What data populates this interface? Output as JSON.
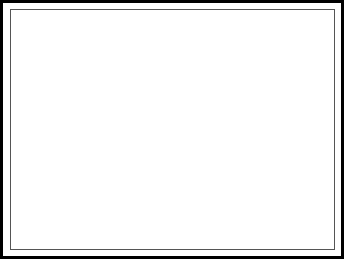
{
  "figure": {
    "type": "node-link-graph-3d",
    "background_color": "#ffffff",
    "outer_border_color": "#000000",
    "inner_border_color": "#555555",
    "edge_color": "#111111",
    "stem_color": "#222222"
  },
  "legend": {
    "node_fills": {
      "black": "#0a0a0a",
      "white": "#ffffff",
      "gray_mid": "#808080",
      "gray_light": "#c8c8c8"
    }
  },
  "base_plate": {
    "name": "pentagonal-base-plate",
    "top_face_fill": "#ffffff",
    "side_face_fill": "#ffffff",
    "stroke": "#111111",
    "thickness_px": 14,
    "top_outline": [
      [
        17,
        127
      ],
      [
        166,
        103
      ],
      [
        325,
        142
      ],
      [
        333,
        191
      ],
      [
        282,
        230
      ],
      [
        13,
        166
      ]
    ]
  },
  "chart_data": {
    "type": "scatter",
    "xlabel": "",
    "ylabel": "",
    "nodes": [
      {
        "id": "n01",
        "x": 153,
        "y": 22,
        "r": 6.5,
        "fill": "white",
        "stem": 0
      },
      {
        "id": "n02",
        "x": 170,
        "y": 20,
        "r": 9.5,
        "fill": "white",
        "stem": 0
      },
      {
        "id": "n03",
        "x": 183,
        "y": 31,
        "r": 6.5,
        "fill": "white",
        "stem": 0
      },
      {
        "id": "n04",
        "x": 152,
        "y": 35,
        "r": 10.5,
        "fill": "black",
        "stem": 0
      },
      {
        "id": "n05",
        "x": 133,
        "y": 38,
        "r": 7.5,
        "fill": "white",
        "stem": 0
      },
      {
        "id": "n06",
        "x": 148,
        "y": 46,
        "r": 7.0,
        "fill": "white",
        "stem": 0
      },
      {
        "id": "n07",
        "x": 277,
        "y": 35,
        "r": 11.5,
        "fill": "gray_light",
        "stem": 0
      },
      {
        "id": "n08",
        "x": 259,
        "y": 33,
        "r": 4.0,
        "fill": "white",
        "stem": 0
      },
      {
        "id": "n09",
        "x": 105,
        "y": 63,
        "r": 8.0,
        "fill": "gray_mid",
        "stem": 0
      },
      {
        "id": "n10",
        "x": 107,
        "y": 70,
        "r": 7.5,
        "fill": "white",
        "stem": 0
      },
      {
        "id": "n11",
        "x": 127,
        "y": 69,
        "r": 8.5,
        "fill": "black",
        "stem": 0
      },
      {
        "id": "n12",
        "x": 91,
        "y": 62,
        "r": 2.5,
        "fill": "black",
        "stem": 0
      },
      {
        "id": "n13",
        "x": 137,
        "y": 70,
        "r": 2.5,
        "fill": "black",
        "stem": 0
      },
      {
        "id": "n14",
        "x": 160,
        "y": 85,
        "r": 9.0,
        "fill": "gray_mid",
        "stem": 0
      },
      {
        "id": "n15",
        "x": 163,
        "y": 93,
        "r": 8.5,
        "fill": "black",
        "stem": 0
      },
      {
        "id": "n16",
        "x": 177,
        "y": 89,
        "r": 8.0,
        "fill": "white",
        "stem": 0
      },
      {
        "id": "n17",
        "x": 150,
        "y": 88,
        "r": 2.5,
        "fill": "black",
        "stem": 0
      },
      {
        "id": "n18",
        "x": 189,
        "y": 89,
        "r": 2.5,
        "fill": "black",
        "stem": 0
      },
      {
        "id": "n19",
        "x": 28,
        "y": 96,
        "r": 8.0,
        "fill": "gray_mid",
        "stem": 0
      },
      {
        "id": "n20",
        "x": 29,
        "y": 105,
        "r": 8.5,
        "fill": "black",
        "stem": 0
      },
      {
        "id": "n21",
        "x": 44,
        "y": 97,
        "r": 7.0,
        "fill": "white",
        "stem": 0
      },
      {
        "id": "n22",
        "x": 48,
        "y": 99,
        "r": 4.0,
        "fill": "white",
        "stem": 0
      },
      {
        "id": "n23",
        "x": 16,
        "y": 97,
        "r": 2.5,
        "fill": "black",
        "stem": 0
      },
      {
        "id": "n24",
        "x": 56,
        "y": 98,
        "r": 2.5,
        "fill": "black",
        "stem": 0
      },
      {
        "id": "n25",
        "x": 277,
        "y": 104,
        "r": 8.0,
        "fill": "gray_light",
        "stem": 0
      },
      {
        "id": "n26",
        "x": 237,
        "y": 124,
        "r": 8.5,
        "fill": "gray_mid",
        "stem": 0
      },
      {
        "id": "n27",
        "x": 214,
        "y": 135,
        "r": 9.5,
        "fill": "black",
        "stem": 0
      },
      {
        "id": "n28",
        "x": 238,
        "y": 139,
        "r": 8.5,
        "fill": "white",
        "stem": 0
      },
      {
        "id": "n29",
        "x": 220,
        "y": 124,
        "r": 5.5,
        "fill": "white",
        "stem": 0
      },
      {
        "id": "n30",
        "x": 205,
        "y": 127,
        "r": 5.0,
        "fill": "black",
        "stem": 0
      },
      {
        "id": "n31",
        "x": 253,
        "y": 125,
        "r": 5.0,
        "fill": "gray_mid",
        "stem": 0
      },
      {
        "id": "n32",
        "x": 205,
        "y": 139,
        "r": 2.5,
        "fill": "black",
        "stem": 0
      },
      {
        "id": "n33",
        "x": 226,
        "y": 136,
        "r": 2.5,
        "fill": "black",
        "stem": 0
      },
      {
        "id": "n34",
        "x": 253,
        "y": 136,
        "r": 4.0,
        "fill": "white",
        "stem": 0
      },
      {
        "id": "n35",
        "x": 69,
        "y": 108,
        "r": 5.5,
        "fill": "black",
        "stem": 16
      },
      {
        "id": "n36",
        "x": 85,
        "y": 110,
        "r": 5.5,
        "fill": "white",
        "stem": 16
      },
      {
        "id": "n37",
        "x": 23,
        "y": 128,
        "r": 4.5,
        "fill": "white",
        "stem": 18
      },
      {
        "id": "n38",
        "x": 26,
        "y": 136,
        "r": 5.0,
        "fill": "black",
        "stem": 18
      },
      {
        "id": "n39",
        "x": 30,
        "y": 146,
        "r": 5.0,
        "fill": "black",
        "stem": 18
      },
      {
        "id": "n40",
        "x": 44,
        "y": 136,
        "r": 5.5,
        "fill": "white",
        "stem": 18
      },
      {
        "id": "n41",
        "x": 63,
        "y": 143,
        "r": 6.0,
        "fill": "black",
        "stem": 20
      },
      {
        "id": "n42",
        "x": 82,
        "y": 131,
        "r": 5.5,
        "fill": "black",
        "stem": 20
      },
      {
        "id": "n43",
        "x": 91,
        "y": 152,
        "r": 5.5,
        "fill": "white",
        "stem": 20
      },
      {
        "id": "n44",
        "x": 70,
        "y": 108,
        "r": 0.0,
        "fill": "black",
        "stem": 0
      },
      {
        "id": "n45",
        "x": 84,
        "y": 110,
        "r": 0.0,
        "fill": "white",
        "stem": 0
      },
      {
        "id": "n46",
        "x": 115,
        "y": 110,
        "r": 5.0,
        "fill": "black",
        "stem": 18
      },
      {
        "id": "n47",
        "x": 114,
        "y": 99,
        "r": 6.0,
        "fill": "white",
        "stem": 18
      },
      {
        "id": "n48",
        "x": 118,
        "y": 109,
        "r": 3.5,
        "fill": "black",
        "stem": 16
      },
      {
        "id": "n49",
        "x": 129,
        "y": 107,
        "r": 5.0,
        "fill": "black",
        "stem": 18
      },
      {
        "id": "n50",
        "x": 83,
        "y": 100,
        "r": 5.5,
        "fill": "white",
        "stem": 16
      },
      {
        "id": "n51",
        "x": 140,
        "y": 128,
        "r": 5.5,
        "fill": "black",
        "stem": 20
      },
      {
        "id": "n52",
        "x": 128,
        "y": 156,
        "r": 5.5,
        "fill": "black",
        "stem": 16
      },
      {
        "id": "n53",
        "x": 163,
        "y": 127,
        "r": 5.5,
        "fill": "black",
        "stem": 22
      },
      {
        "id": "n54",
        "x": 141,
        "y": 126,
        "r": 5.5,
        "fill": "white",
        "stem": 20
      },
      {
        "id": "n55",
        "x": 139,
        "y": 109,
        "r": 5.5,
        "fill": "white",
        "stem": 18
      },
      {
        "id": "n56",
        "x": 163,
        "y": 112,
        "r": 5.5,
        "fill": "black",
        "stem": 20
      },
      {
        "id": "n57",
        "x": 177,
        "y": 111,
        "r": 5.5,
        "fill": "white",
        "stem": 20
      },
      {
        "id": "n58",
        "x": 163,
        "y": 138,
        "r": 5.5,
        "fill": "black",
        "stem": 20
      },
      {
        "id": "n59",
        "x": 184,
        "y": 107,
        "r": 5.5,
        "fill": "white",
        "stem": 20
      },
      {
        "id": "n60",
        "x": 173,
        "y": 156,
        "r": 5.5,
        "fill": "black",
        "stem": 18
      },
      {
        "id": "n61",
        "x": 189,
        "y": 131,
        "r": 5.5,
        "fill": "white",
        "stem": 20
      },
      {
        "id": "n62",
        "x": 189,
        "y": 160,
        "r": 5.5,
        "fill": "white",
        "stem": 20
      },
      {
        "id": "n63",
        "x": 205,
        "y": 154,
        "r": 5.5,
        "fill": "black",
        "stem": 20
      },
      {
        "id": "n64",
        "x": 179,
        "y": 181,
        "r": 5.5,
        "fill": "white",
        "stem": 20
      },
      {
        "id": "n65",
        "x": 224,
        "y": 172,
        "r": 5.5,
        "fill": "black",
        "stem": 20
      },
      {
        "id": "n66",
        "x": 238,
        "y": 165,
        "r": 5.5,
        "fill": "black",
        "stem": 22
      },
      {
        "id": "n67",
        "x": 240,
        "y": 180,
        "r": 5.5,
        "fill": "white",
        "stem": 20
      },
      {
        "id": "n68",
        "x": 240,
        "y": 197,
        "r": 5.5,
        "fill": "black",
        "stem": 20
      },
      {
        "id": "n69",
        "x": 269,
        "y": 194,
        "r": 5.5,
        "fill": "white",
        "stem": 20
      },
      {
        "id": "n70",
        "x": 276,
        "y": 166,
        "r": 5.5,
        "fill": "white",
        "stem": 20
      },
      {
        "id": "n71",
        "x": 285,
        "y": 167,
        "r": 5.5,
        "fill": "gray_mid",
        "stem": 20
      },
      {
        "id": "n72",
        "x": 280,
        "y": 145,
        "r": 5.5,
        "fill": "gray_mid",
        "stem": 22
      },
      {
        "id": "n73",
        "x": 256,
        "y": 121,
        "r": 5.0,
        "fill": "gray_mid",
        "stem": 18
      },
      {
        "id": "n74",
        "x": 271,
        "y": 129,
        "r": 5.0,
        "fill": "gray_mid",
        "stem": 18
      }
    ],
    "edges": [
      [
        "n04",
        "n01"
      ],
      [
        "n04",
        "n02"
      ],
      [
        "n02",
        "n03"
      ],
      [
        "n04",
        "n05"
      ],
      [
        "n04",
        "n06"
      ],
      [
        "n04",
        "n09"
      ],
      [
        "n04",
        "n10"
      ],
      [
        "n04",
        "n14"
      ],
      [
        "n04",
        "n16"
      ],
      [
        "n04",
        "n07"
      ],
      [
        "n06",
        "n09"
      ],
      [
        "n06",
        "n19"
      ],
      [
        "n07",
        "n08"
      ],
      [
        "n07",
        "n09"
      ],
      [
        "n07",
        "n10"
      ],
      [
        "n07",
        "n19"
      ],
      [
        "n07",
        "n21"
      ],
      [
        "n07",
        "n26"
      ],
      [
        "n07",
        "n25"
      ],
      [
        "n07",
        "n16"
      ],
      [
        "n09",
        "n12"
      ],
      [
        "n09",
        "n10"
      ],
      [
        "n09",
        "n11"
      ],
      [
        "n09",
        "n19"
      ],
      [
        "n10",
        "n11"
      ],
      [
        "n11",
        "n13"
      ],
      [
        "n11",
        "n14"
      ],
      [
        "n11",
        "n49"
      ],
      [
        "n11",
        "n47"
      ],
      [
        "n10",
        "n46"
      ],
      [
        "n10",
        "n50"
      ],
      [
        "n14",
        "n17"
      ],
      [
        "n14",
        "n15"
      ],
      [
        "n14",
        "n16"
      ],
      [
        "n15",
        "n16"
      ],
      [
        "n16",
        "n18"
      ],
      [
        "n15",
        "n51"
      ],
      [
        "n15",
        "n53"
      ],
      [
        "n15",
        "n56"
      ],
      [
        "n15",
        "n58"
      ],
      [
        "n15",
        "n54"
      ],
      [
        "n15",
        "n55"
      ],
      [
        "n16",
        "n57"
      ],
      [
        "n16",
        "n59"
      ],
      [
        "n16",
        "n61"
      ],
      [
        "n16",
        "n62"
      ],
      [
        "n15",
        "n52"
      ],
      [
        "n19",
        "n23"
      ],
      [
        "n19",
        "n20"
      ],
      [
        "n19",
        "n21"
      ],
      [
        "n20",
        "n21"
      ],
      [
        "n21",
        "n22"
      ],
      [
        "n22",
        "n24"
      ],
      [
        "n20",
        "n35"
      ],
      [
        "n20",
        "n36"
      ],
      [
        "n20",
        "n37"
      ],
      [
        "n20",
        "n38"
      ],
      [
        "n20",
        "n39"
      ],
      [
        "n20",
        "n40"
      ],
      [
        "n20",
        "n41"
      ],
      [
        "n20",
        "n42"
      ],
      [
        "n20",
        "n43"
      ],
      [
        "n21",
        "n35"
      ],
      [
        "n35",
        "n36"
      ],
      [
        "n42",
        "n43"
      ],
      [
        "n25",
        "n26"
      ],
      [
        "n25",
        "n72"
      ],
      [
        "n26",
        "n27"
      ],
      [
        "n26",
        "n28"
      ],
      [
        "n26",
        "n29"
      ],
      [
        "n26",
        "n31"
      ],
      [
        "n27",
        "n29"
      ],
      [
        "n27",
        "n30"
      ],
      [
        "n27",
        "n28"
      ],
      [
        "n27",
        "n32"
      ],
      [
        "n27",
        "n33"
      ],
      [
        "n28",
        "n34"
      ],
      [
        "n27",
        "n63"
      ],
      [
        "n27",
        "n65"
      ],
      [
        "n27",
        "n66"
      ],
      [
        "n28",
        "n66"
      ],
      [
        "n28",
        "n67"
      ],
      [
        "n28",
        "n68"
      ],
      [
        "n28",
        "n69"
      ],
      [
        "n28",
        "n70"
      ],
      [
        "n28",
        "n71"
      ],
      [
        "n28",
        "n65"
      ],
      [
        "n27",
        "n62"
      ],
      [
        "n27",
        "n64"
      ],
      [
        "n26",
        "n73"
      ],
      [
        "n26",
        "n74"
      ],
      [
        "n16",
        "n27"
      ],
      [
        "n14",
        "n27"
      ],
      [
        "n04",
        "n26"
      ],
      [
        "n02",
        "n16"
      ],
      [
        "n19",
        "n46"
      ],
      [
        "n09",
        "n47"
      ],
      [
        "n11",
        "n55"
      ],
      [
        "n14",
        "n53"
      ],
      [
        "n53",
        "n60"
      ],
      [
        "n27",
        "n60"
      ]
    ]
  }
}
